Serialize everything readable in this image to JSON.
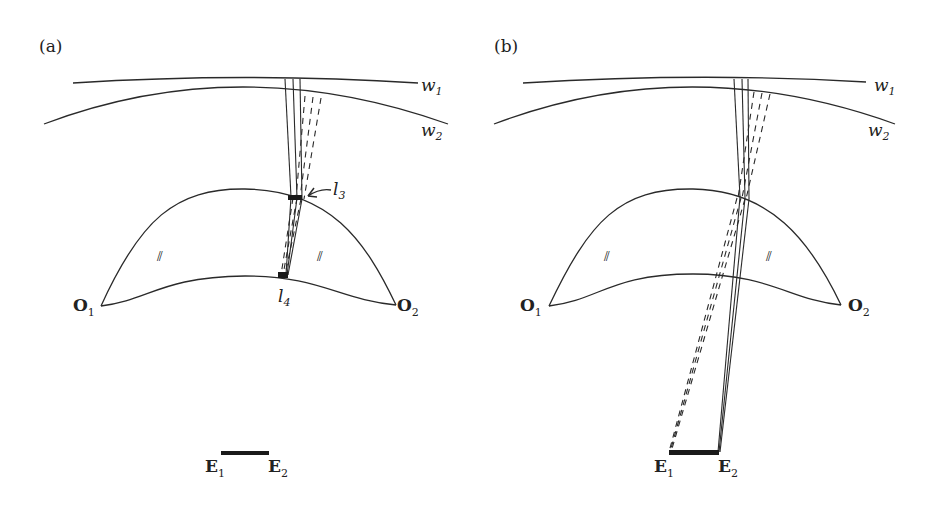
{
  "panels": [
    {
      "id": "a",
      "label": "(a)",
      "wave_labels": {
        "w1": "w",
        "w1_sub": "1",
        "w2": "w",
        "w2_sub": "2"
      },
      "object_labels": {
        "o1": "O",
        "o1_sub": "1",
        "o2": "O",
        "o2_sub": "2"
      },
      "eye_labels": {
        "e1": "E",
        "e1_sub": "1",
        "e2": "E",
        "e2_sub": "2"
      },
      "lens_labels": {
        "l3": "l",
        "l3_sub": "3",
        "l4": "l",
        "l4_sub": "4"
      },
      "hatch_marks": [
        "⫽",
        "⫽"
      ]
    },
    {
      "id": "b",
      "label": "(b)",
      "wave_labels": {
        "w1": "w",
        "w1_sub": "1",
        "w2": "w",
        "w2_sub": "2"
      },
      "object_labels": {
        "o1": "O",
        "o1_sub": "1",
        "o2": "O",
        "o2_sub": "2"
      },
      "eye_labels": {
        "e1": "E",
        "e1_sub": "1",
        "e2": "E",
        "e2_sub": "2"
      },
      "hatch_marks": [
        "⫽",
        "⫽"
      ]
    }
  ],
  "colors": {
    "line": "#2a2a2a",
    "background": "#ffffff"
  }
}
